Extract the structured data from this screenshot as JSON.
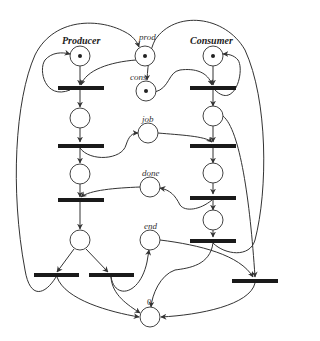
{
  "diagram": {
    "type": "petri-net",
    "colors": {
      "stroke": "#333333",
      "transition": "#1a1a1a",
      "background": "#ffffff"
    },
    "labels": {
      "producer": "Producer",
      "consumer": "Consumer",
      "prod": "prod",
      "cons": "cons",
      "job": "job",
      "done": "done",
      "end": "end",
      "zero": "0"
    },
    "places": [
      {
        "id": "producer",
        "label": "Producer",
        "tokens": 1
      },
      {
        "id": "prod",
        "label": "prod",
        "tokens": 1
      },
      {
        "id": "cons",
        "label": "cons",
        "tokens": 1
      },
      {
        "id": "consumer",
        "label": "Consumer",
        "tokens": 1
      },
      {
        "id": "p_produced",
        "label": "",
        "tokens": 0
      },
      {
        "id": "p_sent",
        "label": "",
        "tokens": 0
      },
      {
        "id": "p_choice",
        "label": "",
        "tokens": 0
      },
      {
        "id": "job",
        "label": "job",
        "tokens": 0
      },
      {
        "id": "done",
        "label": "done",
        "tokens": 0
      },
      {
        "id": "end",
        "label": "end",
        "tokens": 0
      },
      {
        "id": "zero",
        "label": "0",
        "tokens": 0
      },
      {
        "id": "c_received",
        "label": "",
        "tokens": 0
      },
      {
        "id": "c_working",
        "label": "",
        "tokens": 0
      },
      {
        "id": "c_done",
        "label": "",
        "tokens": 0
      }
    ],
    "transitions_count": 9
  }
}
